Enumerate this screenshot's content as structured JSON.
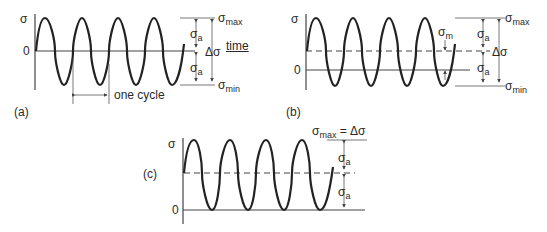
{
  "figure": {
    "panels": [
      {
        "id": "a",
        "label": "(a)",
        "y_axis_label": "σ",
        "zero_label": "0",
        "x_axis_label": "time",
        "annotations": {
          "max": "σ",
          "max_sub": "max",
          "amp_upper": "σ",
          "amp_upper_sub": "a",
          "range": "Δσ",
          "amp_lower": "σ",
          "amp_lower_sub": "a",
          "min": "σ",
          "min_sub": "min",
          "cycle": "one cycle"
        }
      },
      {
        "id": "b",
        "label": "(b)",
        "y_axis_label": "σ",
        "zero_label": "0",
        "annotations": {
          "max": "σ",
          "max_sub": "max",
          "mean": "σ",
          "mean_sub": "m",
          "amp_upper": "σ",
          "amp_upper_sub": "a",
          "range": "Δσ",
          "amp_lower": "σ",
          "amp_lower_sub": "a",
          "min": "σ",
          "min_sub": "min"
        }
      },
      {
        "id": "c",
        "label": "(c)",
        "y_axis_label": "σ",
        "zero_label": "0",
        "annotations": {
          "max": "σ",
          "max_sub": "max",
          "max_eq": " = Δσ",
          "amp_upper": "σ",
          "amp_upper_sub": "a",
          "amp_lower": "σ",
          "amp_lower_sub": "a"
        }
      }
    ]
  }
}
